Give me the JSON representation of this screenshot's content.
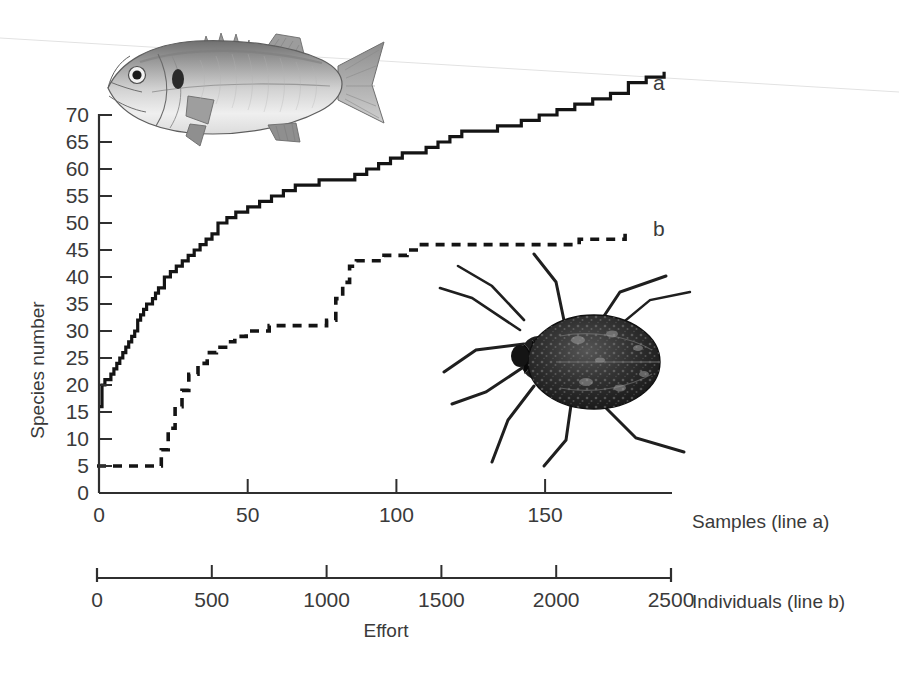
{
  "chart_data": {
    "type": "line",
    "title": "",
    "subtitle": "",
    "xlabel": "Effort",
    "ylabel": "Species number",
    "grid": false,
    "legend_position": "inline-right-end-labels",
    "ylim": [
      0,
      70
    ],
    "y_ticks": [
      0,
      5,
      10,
      15,
      20,
      25,
      30,
      35,
      40,
      45,
      50,
      55,
      60,
      65,
      70
    ],
    "axes": [
      {
        "id": "samples-axis",
        "label": "Samples (line a)",
        "lim": [
          0,
          190
        ],
        "ticks": [
          0,
          50,
          100,
          150
        ],
        "tick_labels": [
          "0",
          "50",
          "100",
          "150"
        ],
        "applies_to_series": "a"
      },
      {
        "id": "individuals-axis",
        "label": "Individuals (line b)",
        "lim": [
          0,
          2500
        ],
        "ticks": [
          0,
          500,
          1000,
          1500,
          2000,
          2500
        ],
        "tick_labels": [
          "0",
          "500",
          "1000",
          "1500",
          "2000",
          "2500"
        ],
        "applies_to_series": "b"
      }
    ],
    "series": [
      {
        "name": "a",
        "label": "a",
        "style": "solid",
        "axis": "samples-axis",
        "organism": "fish",
        "x": [
          0,
          1,
          2,
          3,
          4,
          5,
          6,
          7,
          8,
          9,
          10,
          11,
          12,
          13,
          14,
          15,
          16,
          17,
          18,
          19,
          20,
          22,
          24,
          26,
          28,
          30,
          32,
          34,
          36,
          38,
          40,
          43,
          46,
          50,
          54,
          58,
          62,
          66,
          70,
          74,
          78,
          82,
          86,
          90,
          94,
          98,
          102,
          106,
          110,
          114,
          118,
          122,
          126,
          130,
          134,
          138,
          142,
          148,
          154,
          160,
          166,
          172,
          178,
          184,
          190
        ],
        "y": [
          16,
          20,
          21,
          21,
          22,
          23,
          24,
          25,
          26,
          27,
          28,
          29,
          30,
          32,
          33,
          34,
          35,
          35,
          36,
          37,
          38,
          40,
          41,
          42,
          43,
          44,
          45,
          46,
          47,
          48,
          50,
          51,
          52,
          53,
          54,
          55,
          56,
          57,
          57,
          58,
          58,
          58,
          59,
          60,
          61,
          62,
          63,
          63,
          64,
          65,
          66,
          67,
          67,
          67,
          68,
          68,
          69,
          70,
          71,
          72,
          73,
          74,
          76,
          77,
          78
        ]
      },
      {
        "name": "b",
        "label": "b",
        "style": "dashed",
        "axis": "individuals-axis",
        "organism": "water-bug",
        "x": [
          0,
          50,
          100,
          150,
          200,
          250,
          280,
          310,
          340,
          370,
          400,
          440,
          480,
          520,
          560,
          600,
          650,
          700,
          750,
          800,
          850,
          900,
          950,
          1000,
          1040,
          1070,
          1100,
          1130,
          1160,
          1200,
          1250,
          1300,
          1350,
          1400,
          1500,
          1600,
          1700,
          1800,
          1900,
          2000,
          2100,
          2200,
          2300
        ],
        "y": [
          5,
          5,
          5,
          5,
          5,
          5,
          8,
          12,
          16,
          19,
          22,
          24,
          26,
          27,
          28,
          29,
          30,
          30,
          31,
          31,
          31,
          31,
          31,
          32,
          36,
          39,
          42,
          43,
          43,
          43,
          44,
          44,
          45,
          46,
          46,
          46,
          46,
          46,
          46,
          46,
          47,
          47,
          48
        ]
      }
    ],
    "annotations": [
      {
        "name": "series-a-end-label",
        "text": "a",
        "x_px": 655,
        "y_px": 85
      },
      {
        "name": "series-b-end-label",
        "text": "b",
        "x_px": 655,
        "y_px": 230
      }
    ],
    "illustrations": [
      {
        "name": "fish-illustration",
        "caption": "",
        "refers_to_series": "a"
      },
      {
        "name": "water-bug-illustration",
        "caption": "",
        "refers_to_series": "b"
      }
    ]
  },
  "colors": {
    "line": "#1a1a1a",
    "axis": "#2f2f2f",
    "text": "#3a3a3a",
    "background": "#ffffff",
    "fish_light": "#d9d9d9",
    "fish_mid": "#a8a8a8",
    "fish_dark": "#6e6e6e",
    "bug_body": "#242424",
    "bug_mid": "#4a4a4a"
  }
}
